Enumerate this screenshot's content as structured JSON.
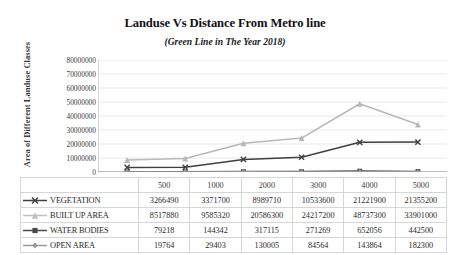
{
  "chart_data": {
    "type": "line",
    "title": "Landuse Vs Distance From Metro line",
    "subtitle": "(Green Line in The Year 2018)",
    "xlabel": "",
    "ylabel": "Area of Different Landuse Classes",
    "categories": [
      "500",
      "1000",
      "2000",
      "3000",
      "4000",
      "5000"
    ],
    "ylim": [
      0,
      80000000
    ],
    "yticks": [
      "0",
      "10000000",
      "20000000",
      "30000000",
      "40000000",
      "50000000",
      "60000000",
      "70000000",
      "80000000"
    ],
    "grid": true,
    "legend_position": "table-left-column",
    "series": [
      {
        "name": "VEGETATION",
        "marker": "x-marker",
        "color": "#404040",
        "values": [
          3266490,
          3371700,
          8989710,
          10533600,
          21221900,
          21355200
        ]
      },
      {
        "name": "BUILT UP AREA",
        "marker": "triangle-marker",
        "color": "#b8b8b8",
        "values": [
          8517880,
          9585320,
          20586300,
          24217200,
          48737300,
          33901000
        ]
      },
      {
        "name": "WATER BODIES",
        "marker": "square-marker",
        "color": "#4a4a4a",
        "values": [
          79218,
          144342,
          317115,
          271269,
          652056,
          442500
        ]
      },
      {
        "name": "OPEN AREA",
        "marker": "diamond-marker",
        "color": "#9a9a9a",
        "values": [
          19764,
          29403,
          130005,
          84564,
          143864,
          182300
        ]
      }
    ],
    "plot_series_order": [
      "BUILT UP AREA",
      "VEGETATION",
      "WATER BODIES",
      "OPEN AREA"
    ],
    "table": {
      "header_row": [
        "",
        "500",
        "1000",
        "2000",
        "3000",
        "4000",
        "5000"
      ],
      "rows": [
        {
          "label": "VEGETATION",
          "marker": "x-marker",
          "color": "#404040",
          "cells": [
            "3266490",
            "3371700",
            "8989710",
            "10533600",
            "21221900",
            "21355200"
          ]
        },
        {
          "label": "BUILT UP AREA",
          "marker": "triangle-marker",
          "color": "#c0c0c0",
          "cells": [
            "8517880",
            "9585320",
            "20586300",
            "24217200",
            "48737300",
            "33901000"
          ]
        },
        {
          "label": "WATER BODIES",
          "marker": "square-marker",
          "color": "#4a4a4a",
          "cells": [
            "79218",
            "144342",
            "317115",
            "271269",
            "652056",
            "442500"
          ]
        },
        {
          "label": "OPEN AREA",
          "marker": "diamond-marker",
          "color": "#9a9a9a",
          "cells": [
            "19764",
            "29403",
            "130005",
            "84564",
            "143864",
            "182300"
          ]
        }
      ]
    }
  }
}
